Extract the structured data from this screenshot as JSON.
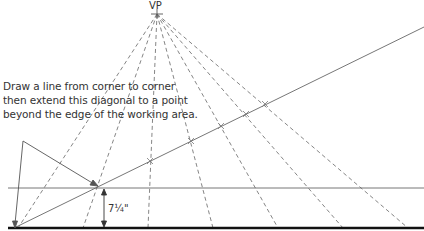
{
  "diagram": {
    "vanishing_point_label": "VP",
    "instruction_lines": [
      "Draw a line from corner to corner",
      "then extend this diagonal to a point",
      "beyond the edge of the working area."
    ],
    "measurement_label": "7¼\"",
    "colors": {
      "line": "#555555",
      "baseline": "#111111",
      "dashed": "#777777"
    }
  }
}
